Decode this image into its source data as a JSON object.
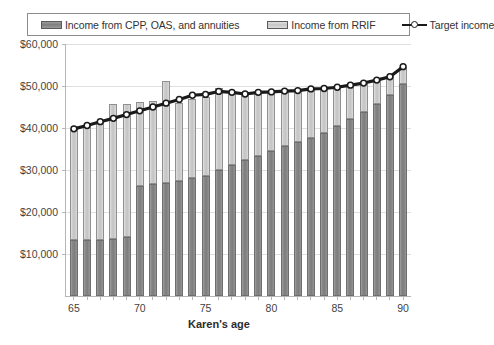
{
  "legend": {
    "items": [
      {
        "label": "Income from CPP, OAS, and annuities",
        "icon": "cpp-swatch",
        "color": "#8a8a8a"
      },
      {
        "label": "Income from RRIF",
        "icon": "rrif-swatch",
        "color": "#cccccc"
      },
      {
        "label": "Target income",
        "icon": "target-line-marker",
        "color": "#1a1a1a"
      }
    ]
  },
  "chart_data": {
    "type": "bar",
    "stacked": true,
    "title": "",
    "xlabel": "Karen's age",
    "ylabel": "",
    "xlim": [
      64.4,
      90.6
    ],
    "ylim": [
      0,
      60000
    ],
    "grid": true,
    "legend_position": "top",
    "ytick_labels": [
      "$10,000",
      "$20,000",
      "$30,000",
      "$40,000",
      "$50,000",
      "$60,000"
    ],
    "ytick_values": [
      10000,
      20000,
      30000,
      40000,
      50000,
      60000
    ],
    "xtick_labels": [
      "65",
      "70",
      "75",
      "80",
      "85",
      "90"
    ],
    "xtick_values": [
      65,
      70,
      75,
      80,
      85,
      90
    ],
    "categories": [
      65,
      66,
      67,
      68,
      69,
      70,
      71,
      72,
      73,
      74,
      75,
      76,
      77,
      78,
      79,
      80,
      81,
      82,
      83,
      84,
      85,
      86,
      87,
      88,
      89,
      90
    ],
    "series": [
      {
        "name": "Income from CPP, OAS, and annuities",
        "color": "#8a8a8a",
        "values": [
          13400,
          13300,
          13300,
          13600,
          14100,
          26300,
          26600,
          26800,
          27300,
          28000,
          28600,
          30000,
          31200,
          32400,
          33400,
          34500,
          35600,
          36700,
          37700,
          38800,
          40400,
          42200,
          43900,
          45800,
          47900,
          50500
        ]
      },
      {
        "name": "Income from RRIF",
        "color": "#cccccc",
        "values": [
          26400,
          27300,
          28200,
          32100,
          31500,
          20000,
          19800,
          24300,
          18600,
          18800,
          18900,
          19600,
          17300,
          15700,
          15100,
          14100,
          13200,
          12200,
          11600,
          10600,
          9300,
          8000,
          6800,
          5600,
          4400,
          4100
        ]
      }
    ],
    "target_line": {
      "name": "Target income",
      "color": "#1a1a1a",
      "marker": "circle-open",
      "values": [
        39800,
        40600,
        41500,
        42300,
        43200,
        44100,
        45000,
        45900,
        46800,
        47800,
        48000,
        48700,
        48500,
        48100,
        48500,
        48600,
        48800,
        48900,
        49300,
        49400,
        49700,
        50200,
        50700,
        51400,
        52200,
        54600
      ]
    }
  }
}
